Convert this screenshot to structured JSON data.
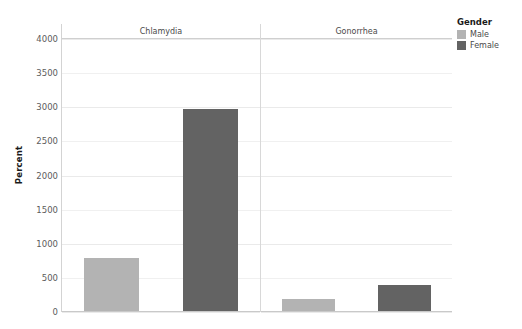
{
  "chart_data": {
    "type": "bar",
    "title": "",
    "subtitle": "",
    "xlabel": "",
    "ylabel": "Percent",
    "ylim": [
      0,
      4000
    ],
    "grid": true,
    "grid_axis": "y",
    "legend_position": "right",
    "facet_titles": [
      "Chlamydia",
      "Gonorrhea"
    ],
    "categories": [
      "Chlamydia",
      "Gonorrhea"
    ],
    "series": [
      {
        "name": "Male",
        "color": "#b3b3b3",
        "values": [
          770,
          175
        ]
      },
      {
        "name": "Female",
        "color": "#636363",
        "values": [
          2960,
          385
        ]
      }
    ],
    "yticks": [
      0,
      500,
      1000,
      1500,
      2000,
      2500,
      3000,
      3500,
      4000
    ],
    "ytick_labels": [
      "0",
      "500",
      "1000",
      "1500",
      "2000",
      "2500",
      "3000",
      "3500",
      "4000"
    ]
  },
  "legend": {
    "title": "Gender",
    "items": [
      {
        "label": "Male",
        "color": "#b3b3b3"
      },
      {
        "label": "Female",
        "color": "#636363"
      }
    ]
  },
  "axis": {
    "y_label": "Percent"
  },
  "panels": [
    {
      "title": "Chlamydia",
      "bars": [
        {
          "series": "Male",
          "value": 770,
          "color": "#b3b3b3"
        },
        {
          "series": "Female",
          "value": 2960,
          "color": "#636363"
        }
      ]
    },
    {
      "title": "Gonorrhea",
      "bars": [
        {
          "series": "Male",
          "value": 175,
          "color": "#b3b3b3"
        },
        {
          "series": "Female",
          "value": 385,
          "color": "#636363"
        }
      ]
    }
  ]
}
